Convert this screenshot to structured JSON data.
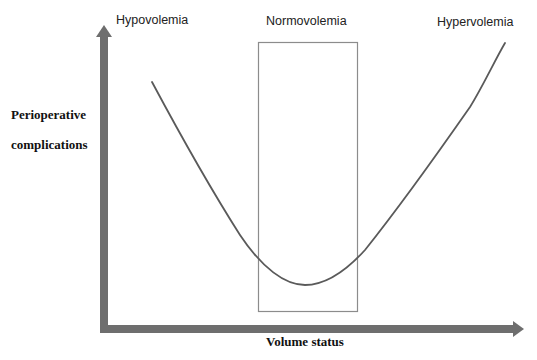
{
  "diagram": {
    "title": "",
    "regions": [
      {
        "id": "hypovolemia",
        "label": "Hypovolemia"
      },
      {
        "id": "normovolemia",
        "label": "Normovolemia"
      },
      {
        "id": "hypervolemia",
        "label": "Hypervolemia"
      }
    ],
    "axes": {
      "y_label_line1": "Perioperative",
      "y_label_line2": "complications",
      "x_label": "Volume status"
    },
    "curve": {
      "shape": "U-shaped",
      "description": "Perioperative complications are high with hypovolemia and hypervolemia, lowest in normovolemia"
    },
    "colors": {
      "axis": "#6e6e6e",
      "curve": "#5a5a5a",
      "box": "#8c8c8c",
      "text": "#1a1a1a"
    }
  }
}
